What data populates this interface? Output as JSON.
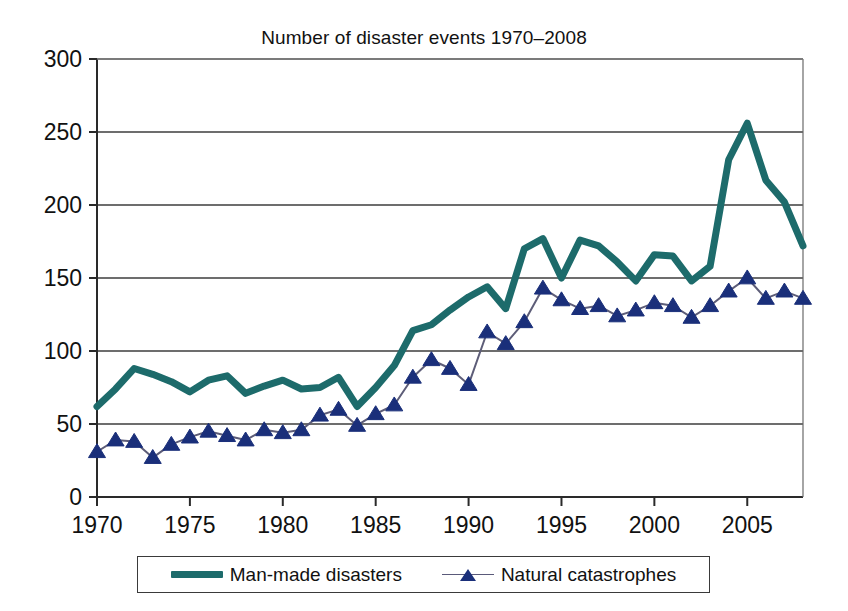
{
  "chart_data": {
    "type": "line",
    "title": "Number of disaster events 1970–2008",
    "xlabel": "",
    "ylabel": "",
    "xlim": [
      1970,
      2008
    ],
    "ylim": [
      0,
      300
    ],
    "yticks": [
      0,
      50,
      100,
      150,
      200,
      250,
      300
    ],
    "ytick_labels": [
      "0",
      "50",
      "100",
      "150",
      "200",
      "250",
      "300"
    ],
    "xticks": [
      1970,
      1975,
      1980,
      1985,
      1990,
      1995,
      2000,
      2005
    ],
    "xtick_labels": [
      "1970",
      "1975",
      "1980",
      "1985",
      "1990",
      "1995",
      "2000",
      "2005"
    ],
    "grid": "horizontal",
    "legend_position": "bottom",
    "x": [
      1970,
      1971,
      1972,
      1973,
      1974,
      1975,
      1976,
      1977,
      1978,
      1979,
      1980,
      1981,
      1982,
      1983,
      1984,
      1985,
      1986,
      1987,
      1988,
      1989,
      1990,
      1991,
      1992,
      1993,
      1994,
      1995,
      1996,
      1997,
      1998,
      1999,
      2000,
      2001,
      2002,
      2003,
      2004,
      2005,
      2006,
      2007,
      2008
    ],
    "series": [
      {
        "name": "Man-made disasters",
        "color": "#1d6b6b",
        "marker": "none",
        "line_width": 7,
        "values": [
          62,
          74,
          88,
          84,
          79,
          72,
          80,
          83,
          71,
          76,
          80,
          74,
          75,
          82,
          62,
          75,
          90,
          114,
          118,
          128,
          137,
          144,
          129,
          170,
          177,
          150,
          176,
          172,
          161,
          148,
          166,
          165,
          148,
          158,
          231,
          256,
          217,
          202,
          172
        ]
      },
      {
        "name": "Natural catastrophes",
        "color": "#1a2f7a",
        "marker": "triangle",
        "line_width": 2,
        "values": [
          31,
          39,
          38,
          27,
          36,
          41,
          45,
          42,
          39,
          46,
          44,
          46,
          56,
          60,
          49,
          57,
          63,
          82,
          94,
          88,
          77,
          113,
          105,
          120,
          143,
          135,
          129,
          131,
          124,
          128,
          133,
          131,
          123,
          131,
          141,
          150,
          136,
          141,
          136
        ]
      }
    ]
  }
}
